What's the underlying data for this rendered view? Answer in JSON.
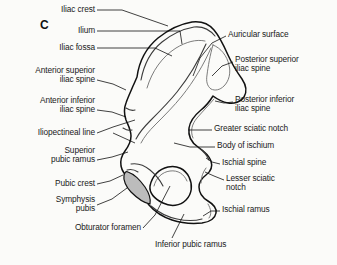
{
  "figure": {
    "panel_letter": "C",
    "background_color": "#fbfbf9",
    "outline_color": "#111111",
    "shading_color": "#bcbcbc"
  },
  "labels_left": [
    {
      "name": "iliac-crest",
      "text": "Iliac crest",
      "x": 95,
      "y": 10,
      "align": "right"
    },
    {
      "name": "ilium",
      "text": "Ilium",
      "x": 95,
      "y": 31,
      "align": "right"
    },
    {
      "name": "iliac-fossa",
      "text": "Iliac fossa",
      "x": 95,
      "y": 47,
      "align": "right"
    },
    {
      "name": "anterior-superior-iliac-spine",
      "text": "Anterior superior\niliac spine",
      "x": 95,
      "y": 71,
      "align": "right"
    },
    {
      "name": "anterior-inferior-iliac-spine",
      "text": "Anterior inferior\niliac spine",
      "x": 95,
      "y": 100,
      "align": "right"
    },
    {
      "name": "iliopectineal-line",
      "text": "Iliopectineal line",
      "x": 95,
      "y": 130,
      "align": "right"
    },
    {
      "name": "superior-pubic-ramus",
      "text": "Superior\npubic ramus",
      "x": 95,
      "y": 150,
      "align": "right"
    },
    {
      "name": "pubic-crest",
      "text": "Pubic crest",
      "x": 95,
      "y": 180,
      "align": "right"
    },
    {
      "name": "symphysis-pubis",
      "text": "Symphysis\npubis",
      "x": 95,
      "y": 196,
      "align": "right"
    },
    {
      "name": "obturator-foramen",
      "text": "Obturator foramen",
      "x": 141,
      "y": 226,
      "align": "right"
    }
  ],
  "labels_right": [
    {
      "name": "auricular-surface",
      "text": "Auricular surface",
      "x": 228,
      "y": 33,
      "align": "left"
    },
    {
      "name": "posterior-superior-iliac-spine",
      "text": "Posterior superior\niliac spine",
      "x": 235,
      "y": 58,
      "align": "left"
    },
    {
      "name": "posterior-inferior-iliac-spine",
      "text": "Posterior inferior\niliac spine",
      "x": 235,
      "y": 98,
      "align": "left"
    },
    {
      "name": "greater-sciatic-notch",
      "text": "Greater sciatic notch",
      "x": 214,
      "y": 127,
      "align": "left"
    },
    {
      "name": "body-of-ischium",
      "text": "Body of ischium",
      "x": 217,
      "y": 144,
      "align": "left"
    },
    {
      "name": "ischial-spine",
      "text": "Ischial spine",
      "x": 222,
      "y": 161,
      "align": "left"
    },
    {
      "name": "lesser-sciatic-notch",
      "text": "Lesser sciatic\nnotch",
      "x": 226,
      "y": 177,
      "align": "left"
    },
    {
      "name": "ischial-ramus",
      "text": "Ischial ramus",
      "x": 222,
      "y": 208,
      "align": "left"
    }
  ],
  "labels_bottom": [
    {
      "name": "inferior-pubic-ramus",
      "text": "Inferior pubic ramus",
      "x": 155,
      "y": 243,
      "align": "left"
    }
  ]
}
